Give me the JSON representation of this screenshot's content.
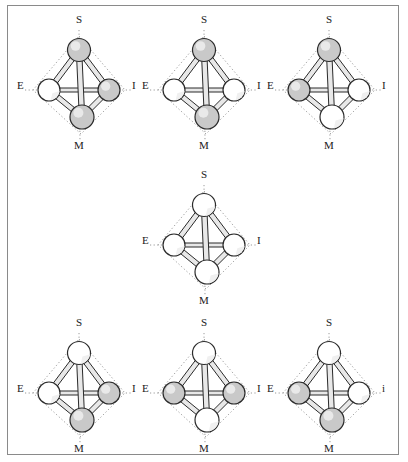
{
  "figure": {
    "type": "diagram",
    "frame_color": "#8a8a8a",
    "background_color": "#ffffff",
    "vertex_label_names": {
      "S": "S",
      "E": "E",
      "I": "I",
      "M": "M"
    },
    "colors": {
      "sphere_shaded": "#c9c9c9",
      "sphere_white": "#ffffff",
      "outline": "#2b2b2b",
      "dotted_diamond": "#9a9a9a",
      "bond": "#e8e8e8"
    },
    "layout": {
      "rows": 3,
      "row1_count": 3,
      "row2_count": 1,
      "row3_count": 3
    },
    "tetrahedra": [
      {
        "id": "tetra-1",
        "row": 1,
        "col": 1,
        "labels": {
          "top": "S",
          "left": "E",
          "right": "I",
          "bottom": "M"
        },
        "vertices": {
          "S": {
            "state": "shaded"
          },
          "E": {
            "state": "white"
          },
          "I": {
            "state": "shaded"
          },
          "M": {
            "state": "shaded"
          }
        }
      },
      {
        "id": "tetra-2",
        "row": 1,
        "col": 2,
        "labels": {
          "top": "S",
          "left": "E",
          "right": "I",
          "bottom": "M"
        },
        "vertices": {
          "S": {
            "state": "shaded"
          },
          "E": {
            "state": "white"
          },
          "I": {
            "state": "white"
          },
          "M": {
            "state": "shaded"
          }
        }
      },
      {
        "id": "tetra-3",
        "row": 1,
        "col": 3,
        "labels": {
          "top": "S",
          "left": "E",
          "right": "I",
          "bottom": "M"
        },
        "vertices": {
          "S": {
            "state": "shaded"
          },
          "E": {
            "state": "shaded"
          },
          "I": {
            "state": "white"
          },
          "M": {
            "state": "white"
          }
        }
      },
      {
        "id": "tetra-4",
        "row": 2,
        "col": 2,
        "labels": {
          "top": "S",
          "left": "E",
          "right": "I",
          "bottom": "M"
        },
        "vertices": {
          "S": {
            "state": "white"
          },
          "E": {
            "state": "white"
          },
          "I": {
            "state": "white"
          },
          "M": {
            "state": "white"
          }
        }
      },
      {
        "id": "tetra-5",
        "row": 3,
        "col": 1,
        "labels": {
          "top": "S",
          "left": "E",
          "right": "I",
          "bottom": "M"
        },
        "vertices": {
          "S": {
            "state": "white"
          },
          "E": {
            "state": "white"
          },
          "I": {
            "state": "shaded"
          },
          "M": {
            "state": "shaded"
          }
        }
      },
      {
        "id": "tetra-6",
        "row": 3,
        "col": 2,
        "labels": {
          "top": "S",
          "left": "E",
          "right": "I",
          "bottom": "M"
        },
        "vertices": {
          "S": {
            "state": "white"
          },
          "E": {
            "state": "shaded"
          },
          "I": {
            "state": "shaded"
          },
          "M": {
            "state": "white"
          }
        }
      },
      {
        "id": "tetra-7",
        "row": 3,
        "col": 3,
        "labels": {
          "top": "S",
          "left": "E",
          "right": "i",
          "bottom": "M"
        },
        "vertices": {
          "S": {
            "state": "white"
          },
          "E": {
            "state": "shaded"
          },
          "I": {
            "state": "white"
          },
          "M": {
            "state": "shaded"
          }
        }
      }
    ]
  }
}
